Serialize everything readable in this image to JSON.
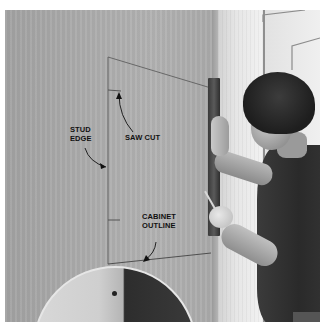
{
  "image": {
    "description": "Man using a level and pencil to mark a cabinet outline on a drywall wall, with a round mirror in the lower foreground",
    "palette": {
      "wall": "#aaaaaa",
      "door_frame": "#e6e6e6",
      "shirt": "#2e2e2e",
      "hair": "#1e1e1e",
      "label_text": "#111111",
      "border": "#ffffff"
    }
  },
  "annotations": {
    "stud_edge": "STUD\nEDGE",
    "saw_cut": "SAW CUT",
    "cabinet_outline": "CABINET\nOUTLINE"
  }
}
